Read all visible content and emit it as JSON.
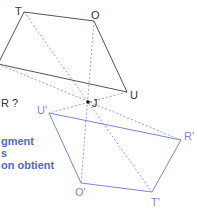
{
  "question_fragment": "R ?",
  "instruction_lines": [
    "gment",
    "s",
    "on obtient"
  ],
  "colors": {
    "original": "#555555",
    "image": "#7a86d6",
    "construction": "#8a93d9",
    "text_blue": "#5566cc"
  },
  "points": {
    "T": {
      "label": "T",
      "x": 24,
      "y": 12
    },
    "O": {
      "label": "O",
      "x": 94,
      "y": 21
    },
    "U": {
      "label": "U",
      "x": 127,
      "y": 92
    },
    "R": {
      "label": "R",
      "x": -2,
      "y": 64
    },
    "J": {
      "label": "J",
      "x": 88,
      "y": 102
    },
    "U'": {
      "label": "U'",
      "x": 49,
      "y": 113
    },
    "R'": {
      "label": "R'",
      "x": 181,
      "y": 140
    },
    "O'": {
      "label": "O'",
      "x": 81,
      "y": 183
    },
    "T'": {
      "label": "T'",
      "x": 152,
      "y": 192
    }
  }
}
